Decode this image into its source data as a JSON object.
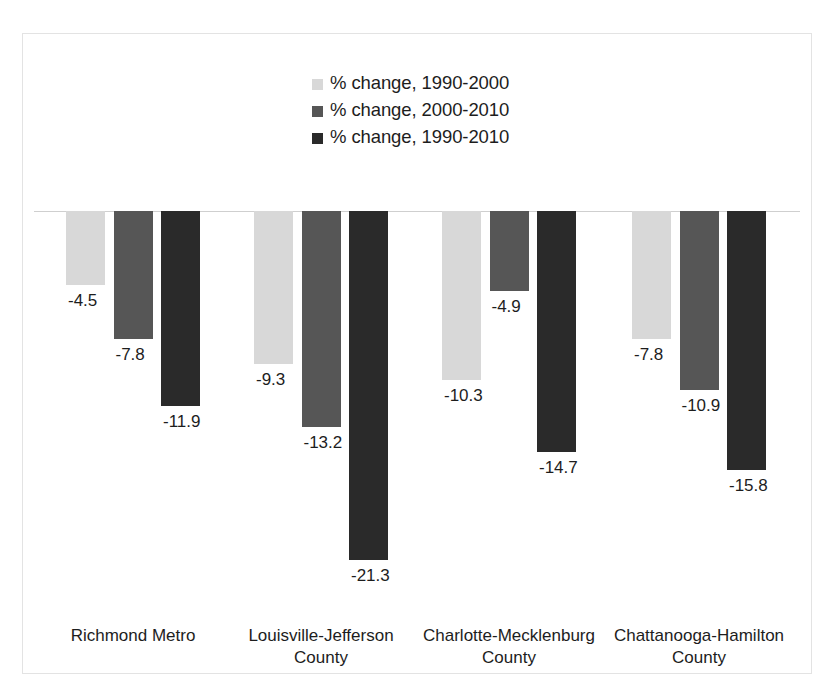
{
  "chart_data": {
    "type": "bar",
    "title": "",
    "subtitle": "",
    "xlabel": "",
    "ylabel": "",
    "orientation": "vertical",
    "grouping": "grouped",
    "grid": false,
    "legend_position": "top-center",
    "axis_zero_line": true,
    "ylim": [
      -24,
      0
    ],
    "value_format": "one-decimal-percent",
    "categories": [
      "Richmond Metro",
      "Louisville-Jefferson County",
      "Charlotte-Mecklenburg County",
      "Chattanooga-Hamilton County"
    ],
    "category_lines": [
      [
        "Richmond Metro"
      ],
      [
        "Louisville-Jefferson",
        "County"
      ],
      [
        "Charlotte-Mecklenburg",
        "County"
      ],
      [
        "Chattanooga-Hamilton",
        "County"
      ]
    ],
    "series": [
      {
        "name": "% change, 1990-2000",
        "color": "#d8d8d8",
        "values": [
          -4.5,
          -9.3,
          -10.3,
          -7.8
        ],
        "labels": [
          "-4.5",
          "-9.3",
          "-10.3",
          "-7.8"
        ]
      },
      {
        "name": "% change, 2000-2010",
        "color": "#565656",
        "values": [
          -7.8,
          -13.2,
          -4.9,
          -10.9
        ],
        "labels": [
          "-7.8",
          "-13.2",
          "-4.9",
          "-10.9"
        ]
      },
      {
        "name": "% change, 1990-2010",
        "color": "#2a2a2a",
        "values": [
          -11.9,
          -21.3,
          -14.7,
          -15.8
        ],
        "labels": [
          "-11.9",
          "-21.3",
          "-14.7",
          "-15.8"
        ]
      }
    ]
  },
  "legend": {
    "items": [
      {
        "label": "% change, 1990-2000",
        "color": "#d8d8d8"
      },
      {
        "label": "% change, 2000-2010",
        "color": "#565656"
      },
      {
        "label": "% change, 1990-2010",
        "color": "#2a2a2a"
      }
    ]
  },
  "colors": {
    "background": "#ffffff",
    "frame_border": "#e3e3e3",
    "zero_axis": "#cfcfcf",
    "text": "#1d1d1d",
    "series_light": "#d8d8d8",
    "series_mid": "#565656",
    "series_dark": "#2a2a2a"
  }
}
